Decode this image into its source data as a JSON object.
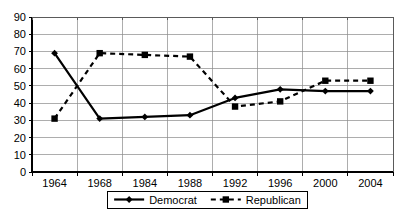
{
  "chart_data": {
    "type": "line",
    "title": "",
    "subtitle": "",
    "xlabel": "",
    "ylabel": "",
    "categories": [
      "1964",
      "1968",
      "1984",
      "1988",
      "1992",
      "1996",
      "2000",
      "2004"
    ],
    "series": [
      {
        "name": "Democrat",
        "values": [
          69,
          31,
          32,
          33,
          43,
          48,
          47,
          47
        ],
        "marker": "diamond",
        "line_style": "solid",
        "color": "#000000"
      },
      {
        "name": "Republican",
        "values": [
          31,
          69,
          68,
          67,
          38,
          41,
          53,
          53
        ],
        "marker": "square",
        "line_style": "dashed",
        "color": "#000000"
      }
    ],
    "ylim": [
      0,
      90
    ],
    "ytick_step": 10,
    "yticks": [
      "0",
      "10",
      "20",
      "30",
      "40",
      "50",
      "60",
      "70",
      "80",
      "90"
    ],
    "xticks": [
      "1964",
      "1968",
      "1984",
      "1988",
      "1992",
      "1996",
      "2000",
      "2004"
    ],
    "grid": {
      "horizontal": true,
      "vertical": true,
      "color": "#808080"
    },
    "legend": {
      "position": "bottom",
      "border": true,
      "entries": [
        {
          "label": "Democrat",
          "marker": "diamond",
          "line_style": "solid"
        },
        {
          "label": "Republican",
          "marker": "square",
          "line_style": "dashed"
        }
      ]
    },
    "axis_color": "#000000",
    "background": "#ffffff"
  }
}
